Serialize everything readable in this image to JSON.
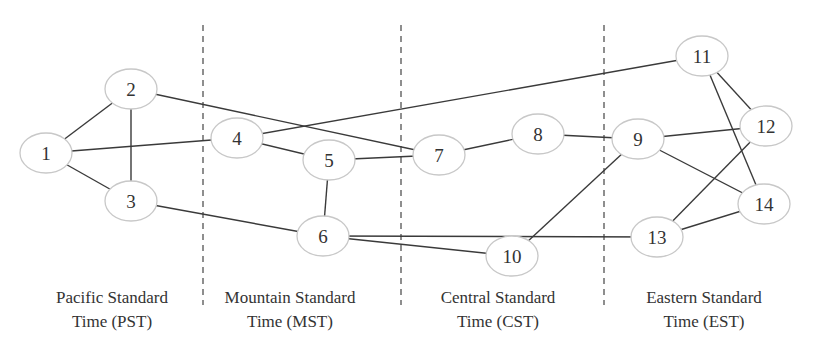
{
  "diagram": {
    "type": "network-graph",
    "dividers_x": [
      203,
      401,
      604
    ],
    "zones": [
      {
        "line1": "Pacific Standard",
        "line2": "Time (PST)",
        "center_x": 112
      },
      {
        "line1": "Mountain Standard",
        "line2": "Time (MST)",
        "center_x": 290
      },
      {
        "line1": "Central Standard",
        "line2": "Time (CST)",
        "center_x": 498
      },
      {
        "line1": "Eastern Standard",
        "line2": "Time (EST)",
        "center_x": 704
      }
    ],
    "nodes": [
      {
        "id": "1",
        "label": "1",
        "x": 46,
        "y": 153
      },
      {
        "id": "2",
        "label": "2",
        "x": 131,
        "y": 89
      },
      {
        "id": "3",
        "label": "3",
        "x": 131,
        "y": 201
      },
      {
        "id": "4",
        "label": "4",
        "x": 237,
        "y": 138
      },
      {
        "id": "5",
        "label": "5",
        "x": 329,
        "y": 160
      },
      {
        "id": "6",
        "label": "6",
        "x": 323,
        "y": 236
      },
      {
        "id": "7",
        "label": "7",
        "x": 439,
        "y": 155
      },
      {
        "id": "8",
        "label": "8",
        "x": 538,
        "y": 134
      },
      {
        "id": "9",
        "label": "9",
        "x": 638,
        "y": 139
      },
      {
        "id": "10",
        "label": "10",
        "x": 512,
        "y": 256
      },
      {
        "id": "11",
        "label": "11",
        "x": 702,
        "y": 56
      },
      {
        "id": "12",
        "label": "12",
        "x": 766,
        "y": 126
      },
      {
        "id": "13",
        "label": "13",
        "x": 657,
        "y": 237
      },
      {
        "id": "14",
        "label": "14",
        "x": 764,
        "y": 204
      }
    ],
    "edges": [
      [
        "1",
        "2"
      ],
      [
        "1",
        "3"
      ],
      [
        "1",
        "4"
      ],
      [
        "2",
        "3"
      ],
      [
        "2",
        "7"
      ],
      [
        "3",
        "6"
      ],
      [
        "4",
        "5"
      ],
      [
        "4",
        "11"
      ],
      [
        "5",
        "6"
      ],
      [
        "5",
        "7"
      ],
      [
        "6",
        "10"
      ],
      [
        "6",
        "13"
      ],
      [
        "7",
        "8"
      ],
      [
        "8",
        "9"
      ],
      [
        "9",
        "12"
      ],
      [
        "9",
        "14"
      ],
      [
        "9",
        "10"
      ],
      [
        "11",
        "12"
      ],
      [
        "11",
        "14"
      ],
      [
        "12",
        "13"
      ],
      [
        "13",
        "14"
      ]
    ]
  }
}
